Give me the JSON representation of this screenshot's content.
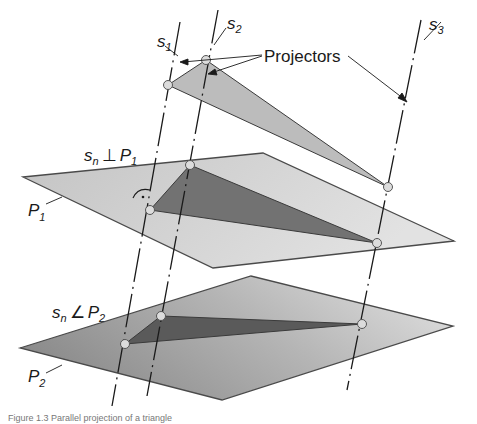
{
  "figure": {
    "annotation": "Projectors",
    "projector_labels": [
      {
        "base": "s",
        "sub": "1"
      },
      {
        "base": "s",
        "sub": "2"
      },
      {
        "base": "s",
        "sub": "3"
      }
    ],
    "plane_labels": [
      {
        "base": "P",
        "sub": "1"
      },
      {
        "base": "P",
        "sub": "2"
      }
    ],
    "relations": [
      {
        "lhs_base": "s",
        "lhs_sub": "n",
        "symbol": "⊥",
        "rhs_base": "P",
        "rhs_sub": "1"
      },
      {
        "lhs_base": "s",
        "lhs_sub": "n",
        "symbol": "∠",
        "rhs_base": "P",
        "rhs_sub": "2"
      }
    ],
    "caption": "Figure 1.3 Parallel projection of a triangle"
  },
  "colors": {
    "plane1_fill": "#c9c9c9",
    "plane2_fill_start": "#8e8e8e",
    "plane2_fill_end": "#d6d6d6",
    "triangle_top_fill": "#bdbdbd",
    "triangle_p1_fill": "#6f6f6f",
    "triangle_p2_fill": "#5e5e5e",
    "outline": "#4a4a4a",
    "vertex_fill": "#dcdcdc",
    "line": "#1a1a1a"
  }
}
